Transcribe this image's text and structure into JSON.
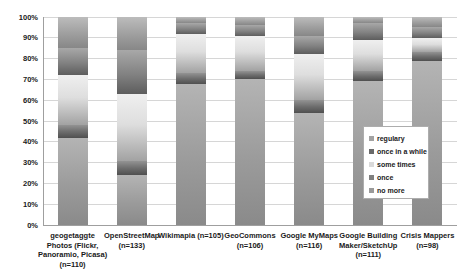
{
  "figure": {
    "width": 468,
    "height": 276,
    "background": "#ffffff",
    "title": ""
  },
  "chart_data": {
    "type": "bar",
    "subtype": "100%-stacked-column",
    "grid": true,
    "title": "",
    "xlabel": "",
    "ylabel": "",
    "ylim": [
      0,
      100
    ],
    "y_ticks": [
      "0%",
      "10%",
      "20%",
      "30%",
      "40%",
      "50%",
      "60%",
      "70%",
      "80%",
      "90%",
      "100%"
    ],
    "legend_position": "inside-right",
    "categories": [
      "geogetaggte Photos (Flickr, Panoramio, Picasa) (n=110)",
      "OpenStreetMap (n=133)",
      "Wikimapia (n=105)",
      "GeoCommons (n=106)",
      "Google MyMaps (n=116)",
      "Google Building Maker/SketchUp (n=111)",
      "Crisis Mappers (n=98)"
    ],
    "category_label_lines": [
      [
        "geogetaggte",
        "Photos (Flickr,",
        "Panoramio, Picasa)",
        "(n=110)"
      ],
      [
        "OpenStreetMap",
        "(n=133)"
      ],
      [
        "Wikimapia (n=105)"
      ],
      [
        "GeoCommons",
        "(n=106)"
      ],
      [
        "Google MyMaps",
        "(n=116)"
      ],
      [
        "Google Building",
        "Maker/SketchUp",
        "(n=111)"
      ],
      [
        "Crisis Mappers",
        "(n=98)"
      ]
    ],
    "series": [
      {
        "name": "regulary",
        "color": "#a2a2a2",
        "values": [
          42,
          24,
          68,
          70,
          54,
          69,
          79
        ]
      },
      {
        "name": "once in a while",
        "color": "#696969",
        "values": [
          6,
          7,
          5,
          4,
          6,
          5,
          4
        ]
      },
      {
        "name": "some times",
        "color": "#d9d9d9",
        "values": [
          24,
          32,
          19,
          17,
          22,
          15,
          7
        ]
      },
      {
        "name": "once",
        "color": "#7f7f7f",
        "values": [
          13,
          21,
          5,
          5,
          9,
          8,
          5
        ]
      },
      {
        "name": "no more",
        "color": "#9a9a9a",
        "values": [
          15,
          16,
          3,
          4,
          9,
          3,
          5
        ]
      }
    ],
    "stack_order_bottom_to_top": [
      "regulary",
      "once in a while",
      "some times",
      "once",
      "no more"
    ]
  },
  "legend": {
    "items": [
      {
        "label": "regulary",
        "color": "#a2a2a2"
      },
      {
        "label": "once in a while",
        "color": "#696969"
      },
      {
        "label": "some times",
        "color": "#d9d9d9"
      },
      {
        "label": "once",
        "color": "#7f7f7f"
      },
      {
        "label": "no more",
        "color": "#9a9a9a"
      }
    ]
  }
}
